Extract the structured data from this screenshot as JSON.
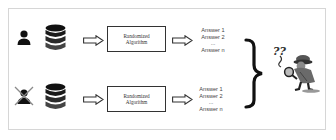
{
  "diagram": {
    "rows": [
      {
        "user": {
          "icon": "person-icon",
          "excluded": false
        },
        "database": {
          "icon": "database-icon"
        },
        "algorithm": {
          "line1": "Randomized",
          "line2": "Algorithm"
        },
        "answers": [
          "Answer 1",
          "Answer 2",
          "...",
          "Answer n"
        ]
      },
      {
        "user": {
          "icon": "person-crossed-out-icon",
          "excluded": true
        },
        "database": {
          "icon": "database-icon"
        },
        "algorithm": {
          "line1": "Randomized",
          "line2": "Algorithm"
        },
        "answers": [
          "Answer 1",
          "Answer 2",
          "...",
          "Answer n"
        ]
      }
    ],
    "adversary": {
      "icon": "detective-with-question-marks-icon",
      "marks": "??"
    },
    "colors": {
      "icon_dark": "#111111",
      "cross": "#888888",
      "border": "#d6d6d6",
      "text": "#444444"
    }
  }
}
